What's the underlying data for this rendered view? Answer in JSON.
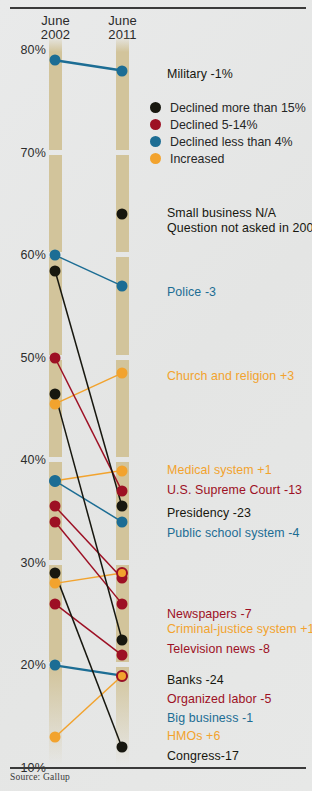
{
  "source_note": "Source: Gallup",
  "colors": {
    "black": "#17170f",
    "red": "#9d1024",
    "blue": "#1c6d94",
    "orange": "#f2a32e",
    "bar": "#d2c49b",
    "background": "#e6e7e6",
    "rule": "#3a3a3a"
  },
  "columns": [
    {
      "id": "left",
      "month": "June",
      "year": "2002"
    },
    {
      "id": "right",
      "month": "June",
      "year": "2011"
    }
  ],
  "legend": {
    "items": [
      {
        "color_key": "black",
        "label": "Declined more than 15%"
      },
      {
        "color_key": "red",
        "label": "Declined 5-14%"
      },
      {
        "color_key": "blue",
        "label": "Declined less than 4%"
      },
      {
        "color_key": "orange",
        "label": "Increased"
      }
    ]
  },
  "chart_data": {
    "type": "line",
    "title": "",
    "subtitle": "",
    "xlabel": "",
    "ylabel": "",
    "x": [
      "June 2002",
      "June 2011"
    ],
    "ylim": [
      10,
      80
    ],
    "ytick_labels": [
      "80%",
      "70%",
      "60%",
      "50%",
      "40%",
      "30%",
      "20%",
      "10%"
    ],
    "ytick_values": [
      80,
      70,
      60,
      50,
      40,
      30,
      20,
      10
    ],
    "grid": false,
    "legend_position": "upper-right",
    "annotations": [
      "Small business N/A",
      "Question not asked in 2002"
    ],
    "series": [
      {
        "name": "Military",
        "change": "-1",
        "color_key": "blue",
        "v2002": 79.0,
        "v2011": 78.0,
        "label": "Military -1%"
      },
      {
        "name": "Small business",
        "change": "N/A",
        "color_key": "black",
        "v2002": null,
        "v2011": 64.0,
        "label": "Small business N/A"
      },
      {
        "name": "Police",
        "change": "-3",
        "color_key": "blue",
        "v2002": 60.0,
        "v2011": 57.0,
        "label": "Police -3"
      },
      {
        "name": "Church and religion",
        "change": "+3",
        "color_key": "orange",
        "v2002": 45.5,
        "v2011": 48.5,
        "label": "Church and religion +3"
      },
      {
        "name": "Medical system",
        "change": "+1",
        "color_key": "orange",
        "v2002": 38.0,
        "v2011": 39.0,
        "label": "Medical system +1"
      },
      {
        "name": "U.S. Supreme Court",
        "change": "-13",
        "color_key": "red",
        "v2002": 50.0,
        "v2011": 37.0,
        "label": "U.S. Supreme Court -13"
      },
      {
        "name": "Presidency",
        "change": "-23",
        "color_key": "black",
        "v2002": 58.5,
        "v2011": 35.5,
        "label": "Presidency -23"
      },
      {
        "name": "Public school system",
        "change": "-4",
        "color_key": "blue",
        "v2002": 38.0,
        "v2011": 34.0,
        "label": "Public school system -4"
      },
      {
        "name": "Newspapers",
        "change": "-7",
        "color_key": "red",
        "v2002": 35.5,
        "v2011": 28.5,
        "label": "Newspapers -7"
      },
      {
        "name": "Criminal-justice system",
        "change": "+1",
        "color_key": "orange",
        "v2002": 28.0,
        "v2011": 29.0,
        "label": "Criminal-justice system +1"
      },
      {
        "name": "Television news",
        "change": "-8",
        "color_key": "red",
        "v2002": 34.0,
        "v2011": 26.0,
        "label": "Television news -8"
      },
      {
        "name": "Banks",
        "change": "-24",
        "color_key": "black",
        "v2002": 46.5,
        "v2011": 22.5,
        "label": "Banks -24"
      },
      {
        "name": "Organized labor",
        "change": "-5",
        "color_key": "red",
        "v2002": 26.0,
        "v2011": 21.0,
        "label": "Organized labor -5"
      },
      {
        "name": "Big business",
        "change": "-1",
        "color_key": "blue",
        "v2002": 20.0,
        "v2011": 19.0,
        "label": "Big business -1"
      },
      {
        "name": "HMOs",
        "change": "+6",
        "color_key": "orange",
        "v2002": 13.0,
        "v2011": 19.0,
        "label": "HMOs +6"
      },
      {
        "name": "Congress",
        "change": "-17",
        "color_key": "black",
        "v2002": 29.0,
        "v2011": 12.0,
        "label": "Congress-17"
      }
    ]
  },
  "plot_geometry": {
    "x_left_px": 55,
    "x_right_px": 122,
    "y_top_px": 50,
    "y_bottom_px": 768,
    "value_top": 80,
    "value_bottom": 10,
    "label_x_px": 167
  },
  "point_labels": [
    {
      "text": "Military -1%",
      "color_key": "black",
      "y": 74
    },
    {
      "text": "Small business N/A",
      "color_key": "black",
      "y": 213
    },
    {
      "text": "Question not asked in 2002",
      "color_key": "black",
      "y": 228
    },
    {
      "text": "Police -3",
      "color_key": "blue",
      "y": 292
    },
    {
      "text": "Church and religion +3",
      "color_key": "orange",
      "y": 376
    },
    {
      "text": "Medical system +1",
      "color_key": "orange",
      "y": 470
    },
    {
      "text": "U.S. Supreme Court -13",
      "color_key": "red",
      "y": 490
    },
    {
      "text": "Presidency -23",
      "color_key": "black",
      "y": 513
    },
    {
      "text": "Public school system -4",
      "color_key": "blue",
      "y": 533
    },
    {
      "text": "Newspapers -7",
      "color_key": "red",
      "y": 614
    },
    {
      "text": "Criminal-justice system +1",
      "color_key": "orange",
      "y": 629
    },
    {
      "text": "Television news -8",
      "color_key": "red",
      "y": 649
    },
    {
      "text": "Banks -24",
      "color_key": "black",
      "y": 680
    },
    {
      "text": "Organized labor -5",
      "color_key": "red",
      "y": 699
    },
    {
      "text": "Big business -1",
      "color_key": "blue",
      "y": 718
    },
    {
      "text": "HMOs +6",
      "color_key": "orange",
      "y": 736
    },
    {
      "text": "Congress-17",
      "color_key": "black",
      "y": 756
    }
  ]
}
